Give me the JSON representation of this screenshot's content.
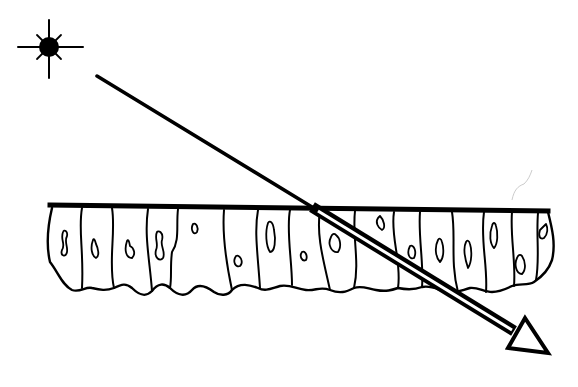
{
  "diagram": {
    "title": "",
    "colors": {
      "ink": "#000000",
      "background": "#ffffff"
    },
    "elements": {
      "light_source": {
        "icon": "sun-icon",
        "center": [
          49,
          47
        ]
      },
      "incident_ray": {
        "from": [
          97,
          76
        ],
        "to": [
          312,
          207
        ]
      },
      "surface_line": {
        "from": [
          50,
          206
        ],
        "to": [
          548,
          213
        ]
      },
      "transmitted_ray": {
        "from": [
          312,
          207
        ],
        "to": [
          518,
          335
        ],
        "style": "double-line"
      },
      "arrow_head": {
        "icon": "hollow-triangle-arrow-icon",
        "tip": [
          549,
          353
        ]
      },
      "cell_layer": {
        "cell_count": 15
      }
    }
  }
}
